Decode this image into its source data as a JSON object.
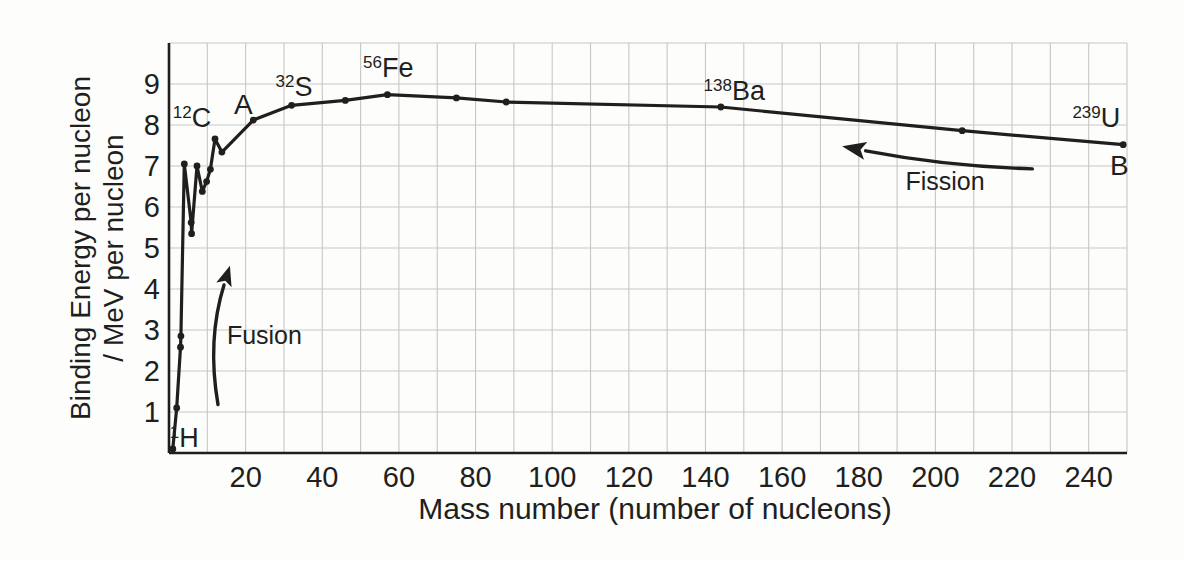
{
  "colors": {
    "ink": "#211f1d",
    "grid": "#c7c7ca",
    "background": "#fdfdfc"
  },
  "chart_data": {
    "type": "line",
    "title": "",
    "xlabel": "Mass number (number of nucleons)",
    "ylabel_line1": "Binding Energy per nucleon",
    "ylabel_line2": "/ MeV per nucleon",
    "xlim": [
      0,
      250
    ],
    "ylim": [
      0,
      10
    ],
    "x_ticks": [
      20,
      40,
      60,
      80,
      100,
      120,
      140,
      160,
      180,
      200,
      220,
      240
    ],
    "y_ticks": [
      1,
      2,
      3,
      4,
      5,
      6,
      7,
      8,
      9
    ],
    "grid": {
      "x_step": 10,
      "y_step": 1,
      "visible": true
    },
    "legend": "none",
    "points": [
      [
        1,
        0.1
      ],
      [
        2,
        1.1
      ],
      [
        3,
        2.58
      ],
      [
        3.1,
        2.85
      ],
      [
        4,
        7.05
      ],
      [
        5.8,
        5.62
      ],
      [
        5.9,
        5.35
      ],
      [
        7.3,
        7.0
      ],
      [
        8.7,
        6.38
      ],
      [
        9.8,
        6.62
      ],
      [
        10.8,
        6.92
      ],
      [
        12,
        7.66
      ],
      [
        13.8,
        7.34
      ],
      [
        22,
        8.12
      ],
      [
        32,
        8.48
      ],
      [
        46,
        8.6
      ],
      [
        57,
        8.74
      ],
      [
        75,
        8.66
      ],
      [
        88,
        8.56
      ],
      [
        144,
        8.44
      ],
      [
        207,
        7.86
      ],
      [
        249,
        7.52
      ]
    ],
    "annotations": [
      {
        "name": "label-1H",
        "sup": "1",
        "text": "H",
        "x": 4.0,
        "y": 0.37,
        "size": 27
      },
      {
        "name": "label-12C",
        "sup": "12",
        "text": "C",
        "x": 6.0,
        "y": 8.18,
        "size": 27
      },
      {
        "name": "label-A",
        "sup": "",
        "text": "A",
        "x": 19.4,
        "y": 8.5,
        "size": 28
      },
      {
        "name": "label-32S",
        "sup": "32",
        "text": "S",
        "x": 32.6,
        "y": 8.93,
        "size": 27
      },
      {
        "name": "label-56Fe",
        "sup": "56",
        "text": "Fe",
        "x": 57.2,
        "y": 9.4,
        "size": 27
      },
      {
        "name": "label-138Ba",
        "sup": "138",
        "text": "Ba",
        "x": 147.5,
        "y": 8.82,
        "size": 27
      },
      {
        "name": "label-239U",
        "sup": "239",
        "text": "U",
        "x": 242.0,
        "y": 8.16,
        "size": 27
      },
      {
        "name": "label-B",
        "sup": "",
        "text": "B",
        "x": 248.0,
        "y": 7.0,
        "size": 28
      },
      {
        "name": "label-fusion",
        "sup": "",
        "text": "Fusion",
        "x": 24.9,
        "y": 2.86,
        "size": 25
      },
      {
        "name": "label-fission",
        "sup": "",
        "text": "Fission",
        "x": 202.5,
        "y": 6.62,
        "size": 25
      }
    ],
    "arrows": [
      {
        "name": "fusion-arrow",
        "start": [
          12.8,
          1.18
        ],
        "ctrl": [
          9.9,
          2.76
        ],
        "end": [
          14.35,
          4.1
        ],
        "head_len": 20,
        "head_halfw": 8
      },
      {
        "name": "fission-arrow",
        "start": [
          225.3,
          6.93
        ],
        "ctrl": [
          202.6,
          7.0
        ],
        "end": [
          181.8,
          7.37
        ],
        "head_len": 24,
        "head_halfw": 9
      }
    ]
  }
}
